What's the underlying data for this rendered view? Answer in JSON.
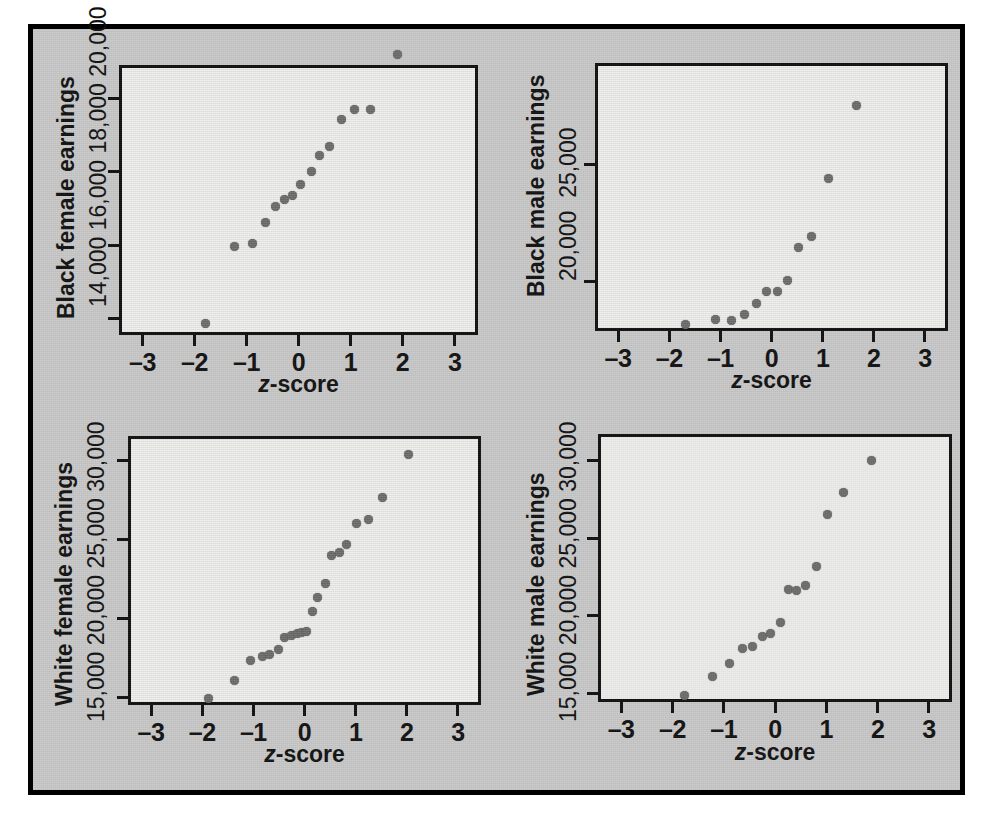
{
  "figure": {
    "background_color": "#c9c9c9",
    "frame_color": "#000000",
    "plot_background_color": "#f0f0ee",
    "point_color": "#6d6d6d",
    "xaxis_title_prefix": "z",
    "xaxis_title_suffix": "-score"
  },
  "chart_data": [
    {
      "type": "scatter",
      "title": "",
      "panel": "top-left",
      "xlabel": "z-score",
      "ylabel": "Black female earnings",
      "xlim": [
        -3.45,
        3.45
      ],
      "ylim": [
        13550,
        20900
      ],
      "xticks": [
        -3,
        -2,
        -1,
        0,
        1,
        2,
        3
      ],
      "xticklabels": [
        "–3",
        "–2",
        "–1",
        "0",
        "1",
        "2",
        "3"
      ],
      "yticks": [
        14000,
        16000,
        18000,
        20000
      ],
      "yticklabels": [
        "14,000",
        "16,000",
        "18,000",
        "20,000"
      ],
      "grid": false,
      "legend": "none",
      "x": [
        -1.84,
        -1.28,
        -0.95,
        -0.7,
        -0.5,
        -0.33,
        -0.18,
        -0.02,
        0.19,
        0.35,
        0.54,
        0.76,
        1.02,
        1.32,
        1.85
      ],
      "y": [
        13950,
        16050,
        16110,
        16700,
        17130,
        17320,
        17440,
        17730,
        18080,
        18520,
        18750,
        19500,
        19760,
        19760,
        21280
      ]
    },
    {
      "type": "scatter",
      "title": "",
      "panel": "top-right",
      "xlabel": "z-score",
      "ylabel": "Black male earnings",
      "xlim": [
        -3.45,
        3.45
      ],
      "ylim": [
        17900,
        29300
      ],
      "xticks": [
        -3,
        -2,
        -1,
        0,
        1,
        2,
        3
      ],
      "xticklabels": [
        "–3",
        "–2",
        "–1",
        "0",
        "1",
        "2",
        "3"
      ],
      "yticks": [
        20000,
        25000
      ],
      "yticklabels": [
        "20,000",
        "25,000"
      ],
      "grid": false,
      "legend": "none",
      "x": [
        -1.73,
        -1.16,
        -0.84,
        -0.59,
        -0.35,
        -0.16,
        0.05,
        0.26,
        0.46,
        0.73,
        1.05,
        1.6
      ],
      "y": [
        18300,
        18520,
        18490,
        18710,
        19210,
        19710,
        19710,
        20190,
        21580,
        22060,
        24510,
        27600
      ]
    },
    {
      "type": "scatter",
      "title": "",
      "panel": "bottom-left",
      "xlabel": "z-score",
      "ylabel": "White female earnings",
      "xlim": [
        -3.45,
        3.45
      ],
      "ylim": [
        14530,
        31550
      ],
      "xticks": [
        -3,
        -2,
        -1,
        0,
        1,
        2,
        3
      ],
      "xticklabels": [
        "–3",
        "–2",
        "–1",
        "0",
        "1",
        "2",
        "3"
      ],
      "yticks": [
        15000,
        20000,
        25000,
        30000
      ],
      "yticklabels": [
        "15,000",
        "20,000",
        "25,000",
        "30,000"
      ],
      "grid": false,
      "legend": "none",
      "x": [
        -1.94,
        -1.42,
        -1.11,
        -0.88,
        -0.74,
        -0.57,
        -0.44,
        -0.32,
        -0.2,
        -0.12,
        -0.01,
        0.09,
        0.2,
        0.36,
        0.47,
        0.62,
        0.77,
        0.96,
        1.19,
        1.47,
        1.98
      ],
      "y": [
        15150,
        16250,
        17530,
        17800,
        17900,
        18250,
        19010,
        19130,
        19220,
        19280,
        19350,
        20660,
        21550,
        22400,
        24200,
        24380,
        24890,
        26190,
        26480,
        27870,
        30590
      ]
    },
    {
      "type": "scatter",
      "title": "",
      "panel": "bottom-right",
      "xlabel": "z-score",
      "ylabel": "White male earnings",
      "xlim": [
        -3.45,
        3.45
      ],
      "ylim": [
        14460,
        31700
      ],
      "xticks": [
        -3,
        -2,
        -1,
        0,
        1,
        2,
        3
      ],
      "xticklabels": [
        "–3",
        "–2",
        "–1",
        "0",
        "1",
        "2",
        "3"
      ],
      "yticks": [
        15000,
        20000,
        25000,
        30000
      ],
      "yticklabels": [
        "15,000",
        "20,000",
        "25,000",
        "30,000"
      ],
      "grid": false,
      "legend": "none",
      "x": [
        -1.83,
        -1.27,
        -0.95,
        -0.7,
        -0.5,
        -0.31,
        -0.14,
        0.04,
        0.2,
        0.36,
        0.54,
        0.76,
        0.97,
        1.28,
        1.83
      ],
      "y": [
        15080,
        16320,
        17110,
        18120,
        18220,
        18870,
        19090,
        19740,
        21880,
        21840,
        22140,
        23340,
        26740,
        28110,
        30190
      ]
    }
  ]
}
